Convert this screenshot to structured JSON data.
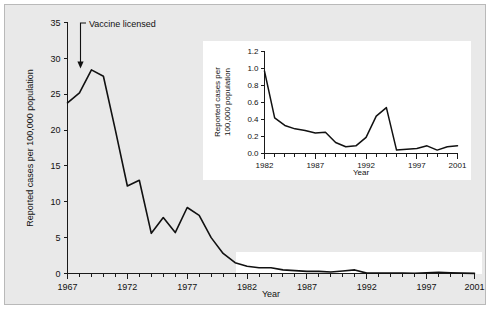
{
  "figure": {
    "background_color": "#e9e9e9",
    "panel_color": "#ffffff",
    "line_color": "#111111",
    "border_color": "#b9b9b9"
  },
  "chart_data": [
    {
      "id": "main",
      "type": "line",
      "title": "",
      "xlabel": "Year",
      "ylabel": "Reported cases per 100,000 population",
      "xlim": [
        1967,
        2001
      ],
      "ylim": [
        0,
        35
      ],
      "yticks": [
        0,
        5,
        10,
        15,
        20,
        25,
        30,
        35
      ],
      "ytick_labels": [
        "0",
        "5",
        "10",
        "15",
        "20",
        "25",
        "30",
        "35"
      ],
      "xticks": [
        1967,
        1972,
        1977,
        1982,
        1987,
        1992,
        1997,
        2001
      ],
      "xtick_labels": [
        "1967",
        "1972",
        "1977",
        "1982",
        "1987",
        "1992",
        "1997",
        "2001"
      ],
      "xtick_minor_interval": 1,
      "grid": false,
      "legend": false,
      "x": [
        1967,
        1968,
        1969,
        1970,
        1971,
        1972,
        1973,
        1974,
        1975,
        1976,
        1977,
        1978,
        1979,
        1980,
        1981,
        1982,
        1983,
        1984,
        1985,
        1986,
        1987,
        1988,
        1989,
        1990,
        1991,
        1992,
        1993,
        1994,
        1995,
        1996,
        1997,
        1998,
        1999,
        2000,
        2001
      ],
      "values": [
        23.8,
        25.2,
        28.4,
        27.5,
        20.0,
        12.2,
        13.0,
        5.6,
        7.8,
        5.7,
        9.2,
        8.1,
        5.0,
        2.8,
        1.5,
        1.0,
        0.8,
        0.8,
        0.5,
        0.4,
        0.3,
        0.3,
        0.2,
        0.35,
        0.5,
        0.05,
        0.05,
        0.07,
        0.07,
        0.04,
        0.1,
        0.18,
        0.1,
        0.05,
        0.02
      ],
      "annotations": [
        {
          "text": "Vaccine licensed",
          "at_x": 1969,
          "at_y": 30.0
        }
      ]
    },
    {
      "id": "inset",
      "type": "line",
      "title": "",
      "xlabel": "Year",
      "ylabel": "Reported cases per 100,000 population",
      "xlim": [
        1982,
        2001
      ],
      "ylim": [
        0.0,
        1.2
      ],
      "yticks": [
        0.0,
        0.2,
        0.4,
        0.6,
        0.8,
        1.0,
        1.2
      ],
      "ytick_labels": [
        "0.0",
        "0.2",
        "0.4",
        "0.6",
        "0.8",
        "1.0",
        "1.2"
      ],
      "xticks": [
        1982,
        1987,
        1992,
        1997,
        2001
      ],
      "xtick_labels": [
        "1982",
        "1987",
        "1992",
        "1997",
        "2001"
      ],
      "xtick_minor_interval": 1,
      "grid": false,
      "legend": false,
      "x": [
        1982,
        1983,
        1984,
        1985,
        1986,
        1987,
        1988,
        1989,
        1990,
        1991,
        1992,
        1993,
        1994,
        1995,
        1996,
        1997,
        1998,
        1999,
        2000,
        2001
      ],
      "values": [
        0.97,
        0.42,
        0.33,
        0.29,
        0.27,
        0.24,
        0.25,
        0.13,
        0.08,
        0.09,
        0.19,
        0.44,
        0.54,
        0.04,
        0.05,
        0.06,
        0.09,
        0.04,
        0.08,
        0.09
      ],
      "values_tail": [
        0.05,
        0.19,
        0.14,
        0.09,
        0.05,
        0.01
      ]
    }
  ]
}
